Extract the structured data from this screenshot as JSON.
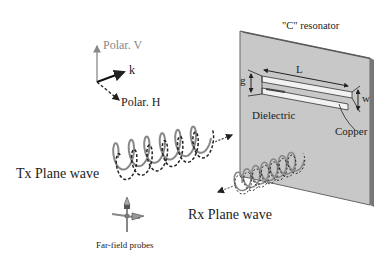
{
  "diagram": {
    "resonator_title": "\"C\" resonator",
    "dimension_L": "L",
    "dimension_g": "g",
    "dimension_w": "w",
    "dielectric_label": "Dielectric",
    "copper_label": "Copper",
    "axis_vertical": "Polar. V",
    "axis_k": "k",
    "axis_horizontal": "Polar. H",
    "tx_label": "Tx Plane wave",
    "rx_label": "Rx Plane wave",
    "probes_label": "Far-field probes"
  },
  "colors": {
    "panel_fill": "#c8c8c8",
    "panel_edge": "#555555",
    "wave_solid": "#888888",
    "wave_dashed": "#222222",
    "polar_v": "#888888"
  }
}
